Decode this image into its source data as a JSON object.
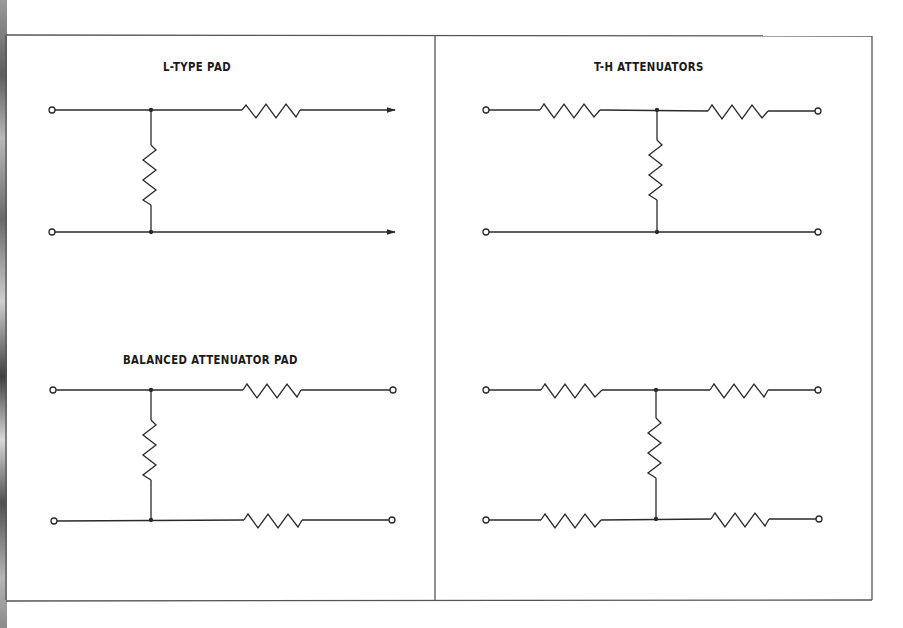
{
  "figure": {
    "panels": [
      {
        "id": "l-type-pad",
        "title": "L-TYPE PAD"
      },
      {
        "id": "t-h-attenuators",
        "title": "T-H ATTENUATORS"
      },
      {
        "id": "balanced-attenuator-pad",
        "title": "BALANCED ATTENUATOR PAD"
      },
      {
        "id": "h-attenuator",
        "title": ""
      }
    ],
    "colors": {
      "line": "#2a2a2a",
      "frame": "#555555",
      "background": "#ffffff"
    }
  }
}
